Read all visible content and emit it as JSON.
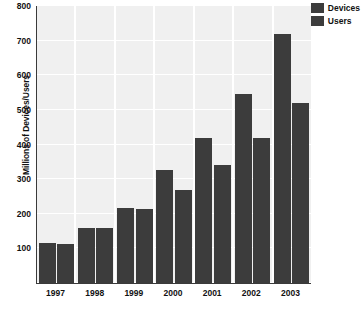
{
  "chart_data": {
    "type": "bar",
    "title": "",
    "xlabel": "",
    "ylabel": "Millions of Devices/Users",
    "categories": [
      "1997",
      "1998",
      "1999",
      "2000",
      "2001",
      "2002",
      "2003"
    ],
    "series": [
      {
        "name": "Devices",
        "values": [
          115,
          160,
          218,
          325,
          420,
          545,
          720
        ]
      },
      {
        "name": "Users",
        "values": [
          113,
          158,
          215,
          270,
          340,
          420,
          520
        ]
      }
    ],
    "ylim": [
      0,
      800
    ],
    "yticks": [
      0,
      100,
      200,
      300,
      400,
      500,
      600,
      700,
      800
    ],
    "ytick_labels": [
      "",
      "100",
      "200",
      "300",
      "400",
      "500",
      "600",
      "700",
      "800"
    ],
    "grid": true,
    "legend_position": "top-right",
    "colors": {
      "devices": "#3c3c3c",
      "users": "#3c3c3c",
      "panel_band": "#f0f0f0",
      "gridline": "#ffffff",
      "axis": "#3a3a3a",
      "text": "#111111"
    }
  }
}
